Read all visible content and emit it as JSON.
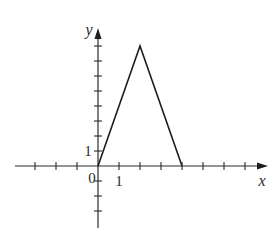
{
  "chart_data": {
    "type": "line",
    "title": "",
    "xlabel": "x",
    "ylabel": "y",
    "x": [
      0,
      2,
      4
    ],
    "series": [
      {
        "name": "piecewise-linear",
        "values": [
          0,
          8,
          0
        ]
      }
    ],
    "xlim": [
      -3.9,
      8.1
    ],
    "ylim": [
      -4.2,
      9.1
    ],
    "x_ticks": [
      -3,
      -2,
      -1,
      1,
      2,
      3,
      4,
      5,
      6,
      7
    ],
    "y_ticks": [
      -3,
      -2,
      -1,
      1,
      2,
      3,
      4,
      5,
      6,
      7,
      8
    ],
    "tick_labels": {
      "origin": "0",
      "x_unit": "1",
      "y_unit": "1"
    },
    "grid": false,
    "legend": null
  },
  "geometry": {
    "origin_px": [
      98,
      166
    ],
    "unit_x_px": 21,
    "unit_y_px": 15,
    "x_axis_px": [
      15,
      268
    ],
    "y_axis_px": [
      228,
      28
    ]
  }
}
